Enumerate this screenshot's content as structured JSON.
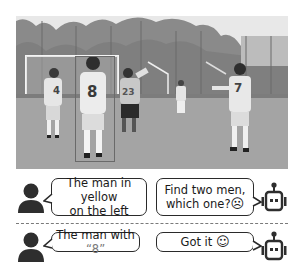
{
  "photo": {
    "description": "grayscale soccer field photo with players",
    "jersey_numbers": [
      "4",
      "8",
      "23",
      "7"
    ],
    "highlight_box": {
      "target_jersey": "8",
      "color": "#6a6a6a"
    }
  },
  "dialogues": [
    {
      "user_icon": "person-icon",
      "user_text": "The man in yellow on the left",
      "user_lines": [
        "The man in yellow",
        "on the left"
      ],
      "bot_icon": "robot-icon",
      "bot_lines": [
        "Find two men,",
        "which one?"
      ],
      "bot_emoji": "sad-face-icon",
      "bot_emoji_glyph": "☹"
    },
    {
      "user_icon": "person-icon",
      "user_prefix": "The man with ",
      "user_quote": "“8”",
      "bot_icon": "robot-icon",
      "bot_text": "Got it ",
      "bot_emoji": "smile-face-icon",
      "bot_emoji_glyph": "☺"
    }
  ],
  "colors": {
    "ink": "#2a2a2a",
    "divider": "#7a7a7a",
    "quote": "#7a7a7a"
  }
}
